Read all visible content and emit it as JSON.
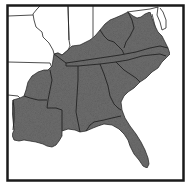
{
  "map": {
    "title": "Southeastern United States",
    "region_fill": "#6e6e6e",
    "other_fill": "#ffffff",
    "border_color": "#1a1a1a",
    "highlighted_states": [
      "Kentucky",
      "West Virginia",
      "Virginia",
      "Tennessee",
      "North Carolina",
      "South Carolina",
      "Georgia",
      "Alabama",
      "Mississippi",
      "Arkansas",
      "Louisiana",
      "Florida"
    ],
    "unshaded_states": [
      "Illinois",
      "Indiana",
      "Ohio",
      "Missouri",
      "Maryland",
      "Delaware",
      "Texas",
      "Oklahoma"
    ]
  }
}
